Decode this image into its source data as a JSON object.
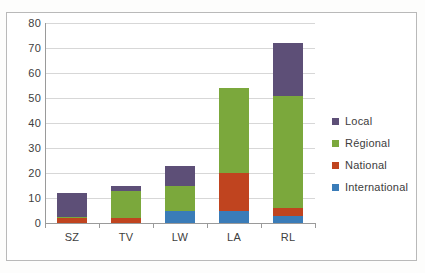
{
  "chart_data": {
    "type": "bar",
    "subtype": "stacked-bar",
    "title": "",
    "subtitle": "",
    "xlabel": "",
    "ylabel": "",
    "categories": [
      "SZ",
      "TV",
      "LW",
      "LA",
      "RL"
    ],
    "series": [
      {
        "name": "International",
        "color": "#3a7cb8",
        "values": [
          0,
          0,
          5,
          5,
          3
        ]
      },
      {
        "name": "National",
        "color": "#c0441f",
        "values": [
          2,
          2,
          0,
          15,
          3
        ]
      },
      {
        "name": "Régional",
        "color": "#7ba83c",
        "values": [
          0.5,
          11,
          10,
          34,
          45
        ]
      },
      {
        "name": "Local",
        "color": "#5d4f77",
        "values": [
          9.5,
          2,
          8,
          0,
          21
        ]
      }
    ],
    "stack_order_bottom_to_top": [
      "International",
      "National",
      "Régional",
      "Local"
    ],
    "totals": [
      12,
      15,
      23,
      54,
      72
    ],
    "ylim": [
      0,
      80
    ],
    "ytick_step": 10,
    "yticks": [
      0,
      10,
      20,
      30,
      40,
      50,
      60,
      70,
      80
    ],
    "ytick_labels": [
      "0",
      "10",
      "20",
      "30",
      "40",
      "50",
      "60",
      "70",
      "80"
    ],
    "grid": {
      "horizontal": true,
      "vertical": false
    },
    "legend": {
      "position": "right",
      "entries": [
        {
          "label": "Local",
          "color": "#5d4f77"
        },
        {
          "label": "Régional",
          "color": "#7ba83c"
        },
        {
          "label": "National",
          "color": "#c0441f"
        },
        {
          "label": "International",
          "color": "#3a7cb8"
        }
      ]
    },
    "colors": {
      "local": "#5d4f77",
      "regional": "#7ba83c",
      "national": "#c0441f",
      "international": "#3a7cb8",
      "gridline": "#d7d7d7",
      "axis": "#9a9a9a",
      "plot_background": "#ffffff",
      "frame_border": "#b9b9b9",
      "tick_text": "#404040"
    }
  }
}
